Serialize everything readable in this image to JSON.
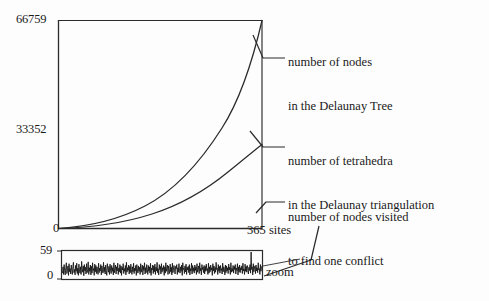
{
  "figure": {
    "kind": "scanned-figure",
    "background_color": "#fdfdfd",
    "ink_color": "#1a1a1a"
  },
  "main_plot": {
    "y_axis": {
      "top_label": "66759",
      "mid_label": "33352",
      "origin_label": "0"
    },
    "x_axis": {
      "origin_label": "0",
      "max_label": "365 sites"
    }
  },
  "annotations": [
    {
      "id": "nodes-delaunay-tree",
      "line1": "number of nodes",
      "line2": "in the Delaunay Tree"
    },
    {
      "id": "tetrahedra-delaunay-triangulation",
      "line1": "number of tetrahedra",
      "line2": "in the Delaunay triangulation"
    },
    {
      "id": "nodes-visited-one-conflict",
      "line1": "number of nodes visited",
      "line2": "to find one conflict"
    }
  ],
  "inset": {
    "caption": "zoom",
    "y_axis": {
      "top_label": "59",
      "bottom_label": "0"
    }
  },
  "chart_data": {
    "type": "line",
    "title": "",
    "xlabel": "365 sites",
    "ylabel": "",
    "xlim": [
      0,
      365
    ],
    "ylim": [
      0,
      66759
    ],
    "grid": false,
    "legend_position": "right-annotations",
    "yticks": [
      0,
      33352,
      66759
    ],
    "ytick_labels": [
      "0",
      "33352",
      "66759"
    ],
    "xticks": [
      0,
      365
    ],
    "xtick_labels": [
      "0",
      "365 sites"
    ],
    "x": [
      0,
      18,
      37,
      55,
      73,
      91,
      110,
      128,
      146,
      164,
      183,
      201,
      219,
      237,
      256,
      274,
      292,
      310,
      329,
      347,
      365
    ],
    "series": [
      {
        "name": "number of nodes in the Delaunay Tree",
        "values": [
          0,
          700,
          1700,
          3000,
          4600,
          6500,
          8700,
          11200,
          14000,
          17100,
          20500,
          24200,
          28200,
          32500,
          37100,
          42000,
          47200,
          52700,
          58500,
          62600,
          66759
        ]
      },
      {
        "name": "number of tetrahedra in the Delaunay triangulation",
        "values": [
          0,
          380,
          880,
          1500,
          2250,
          3150,
          4200,
          5400,
          6750,
          8250,
          9900,
          11700,
          13650,
          15750,
          18000,
          20400,
          22950,
          25650,
          28500,
          31500,
          34600
        ]
      }
    ],
    "inset_chart": {
      "type": "line",
      "title": "zoom",
      "ylim": [
        0,
        59
      ],
      "ytick_labels": [
        "0",
        "59"
      ],
      "description": "number of nodes visited to find one conflict, high-frequency noisy signal over the sites",
      "values": [
        12,
        26,
        9,
        31,
        17,
        8,
        24,
        35,
        11,
        19,
        28,
        7,
        33,
        15,
        22,
        10,
        30,
        18,
        9,
        27,
        36,
        13,
        20,
        8,
        29,
        16,
        34,
        11,
        23,
        7,
        32,
        19,
        12,
        26,
        9,
        38,
        21,
        14,
        28,
        6,
        31,
        17,
        25,
        10,
        33,
        13,
        20,
        37,
        9,
        24,
        16,
        30,
        8,
        27,
        12,
        35,
        18,
        22,
        7,
        32,
        15,
        29,
        11,
        26,
        19,
        9,
        34,
        13,
        23,
        17,
        31,
        8,
        28,
        20,
        12,
        36,
        15,
        25,
        10,
        30,
        18,
        7,
        33,
        22,
        14,
        27,
        9,
        32,
        19,
        11,
        29,
        16,
        24,
        8,
        35,
        13,
        21,
        30,
        10,
        26,
        17,
        34,
        9,
        23,
        15,
        31,
        12,
        28,
        7,
        25,
        19,
        33,
        11,
        22,
        16,
        29,
        8,
        36,
        14,
        24,
        18,
        30,
        10,
        27,
        13,
        32,
        20,
        9,
        26,
        15,
        34,
        11,
        23,
        17,
        29,
        7,
        31,
        19,
        12,
        28,
        16,
        25,
        9,
        33,
        14,
        22,
        30,
        8,
        27,
        18,
        35,
        10,
        24,
        13,
        31,
        21,
        9,
        29,
        16,
        26,
        12,
        34,
        7,
        23,
        19,
        30,
        11,
        28,
        15,
        32,
        9,
        25,
        17,
        36,
        13,
        22,
        8,
        31,
        20,
        27,
        10,
        33,
        14,
        24,
        18,
        29,
        7,
        26,
        12,
        35,
        16,
        23,
        30,
        9,
        28,
        19,
        11,
        32,
        15,
        25,
        8,
        34,
        13,
        21,
        29,
        17,
        10,
        27,
        22,
        31,
        9,
        24,
        14,
        33,
        18,
        12,
        26,
        16,
        30,
        7,
        35,
        20,
        23,
        11,
        28,
        15,
        32,
        9,
        25,
        19,
        27,
        13,
        31,
        8,
        22,
        17,
        34,
        10,
        29,
        16,
        24,
        12,
        30,
        18,
        26,
        9,
        33,
        14,
        21,
        28,
        11,
        35,
        17,
        23,
        8,
        31,
        20,
        25,
        13,
        29,
        10,
        27,
        16,
        32,
        18,
        22,
        9,
        34,
        12,
        26,
        15,
        30,
        19,
        24,
        7,
        33,
        17,
        28,
        11,
        25,
        14,
        36,
        20,
        23,
        9,
        31,
        16,
        27,
        12,
        29,
        18,
        22,
        10,
        34,
        15,
        26,
        21,
        8,
        30,
        13,
        28,
        17,
        24,
        11,
        32,
        19,
        25,
        9,
        35,
        14,
        22,
        16,
        29,
        12,
        27,
        20,
        31,
        10,
        23,
        18,
        33,
        8,
        26,
        15,
        30,
        13,
        24,
        19,
        28,
        11,
        34,
        17,
        21,
        9,
        32,
        16,
        27,
        14,
        29,
        22,
        10,
        25,
        18,
        31,
        12,
        59,
        20,
        26,
        8,
        33,
        15,
        23,
        28,
        11,
        30,
        17,
        24,
        13,
        35,
        19,
        22,
        9,
        31,
        16,
        27
      ]
    }
  }
}
